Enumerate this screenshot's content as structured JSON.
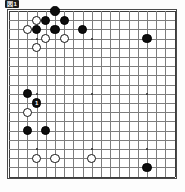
{
  "caption": {
    "text": "図1"
  },
  "board": {
    "size": 19,
    "name": "go-board",
    "left": 9,
    "top": 11,
    "spacing": 9.2,
    "stone_diameter": 9.4,
    "line_color": "#7d7d7d",
    "edge_color": "#3d3d3d",
    "background": "#ffffff",
    "black_color": "#0d0d0d",
    "white_color": "#ffffff",
    "star_points": [
      {
        "col": 3,
        "row": 3
      },
      {
        "col": 9,
        "row": 3
      },
      {
        "col": 15,
        "row": 3
      },
      {
        "col": 3,
        "row": 9
      },
      {
        "col": 9,
        "row": 9
      },
      {
        "col": 15,
        "row": 9
      },
      {
        "col": 3,
        "row": 15
      },
      {
        "col": 9,
        "row": 15
      },
      {
        "col": 15,
        "row": 15
      }
    ],
    "stones": [
      {
        "col": 5,
        "row": 0,
        "color": "black",
        "label": ""
      },
      {
        "col": 3,
        "row": 1,
        "color": "white",
        "label": ""
      },
      {
        "col": 4,
        "row": 1,
        "color": "black",
        "label": ""
      },
      {
        "col": 6,
        "row": 1,
        "color": "black",
        "label": ""
      },
      {
        "col": 2,
        "row": 2,
        "color": "white",
        "label": ""
      },
      {
        "col": 3,
        "row": 2,
        "color": "black",
        "label": ""
      },
      {
        "col": 5,
        "row": 2,
        "color": "black",
        "label": ""
      },
      {
        "col": 8,
        "row": 2,
        "color": "black",
        "label": ""
      },
      {
        "col": 4,
        "row": 3,
        "color": "white",
        "label": ""
      },
      {
        "col": 6,
        "row": 3,
        "color": "white",
        "label": ""
      },
      {
        "col": 15,
        "row": 3,
        "color": "black",
        "label": ""
      },
      {
        "col": 3,
        "row": 4,
        "color": "white",
        "label": ""
      },
      {
        "col": 2,
        "row": 9,
        "color": "black",
        "label": ""
      },
      {
        "col": 3,
        "row": 10,
        "color": "black",
        "label": "1"
      },
      {
        "col": 2,
        "row": 11,
        "color": "white",
        "label": ""
      },
      {
        "col": 2,
        "row": 13,
        "color": "black",
        "label": ""
      },
      {
        "col": 4,
        "row": 13,
        "color": "black",
        "label": ""
      },
      {
        "col": 3,
        "row": 16,
        "color": "white",
        "label": ""
      },
      {
        "col": 5,
        "row": 16,
        "color": "white",
        "label": ""
      },
      {
        "col": 9,
        "row": 16,
        "color": "white",
        "label": ""
      },
      {
        "col": 15,
        "row": 17,
        "color": "black",
        "label": ""
      }
    ]
  }
}
